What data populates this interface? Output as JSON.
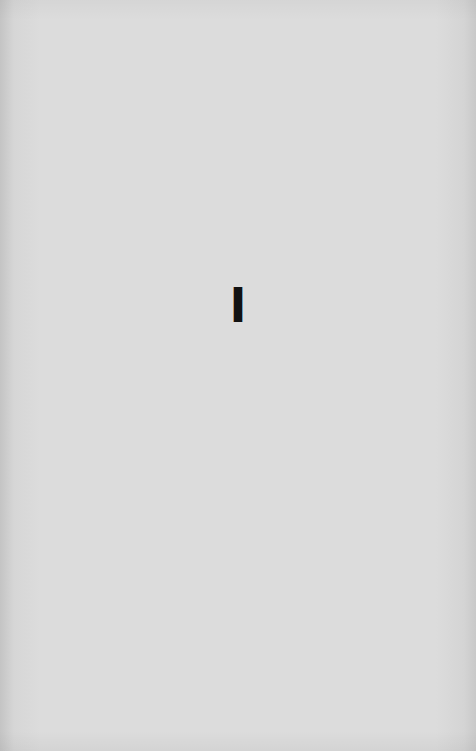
{
  "page": {
    "background_color": "#dcdcdc",
    "part_numeral": "I",
    "text_color": "#111111"
  }
}
